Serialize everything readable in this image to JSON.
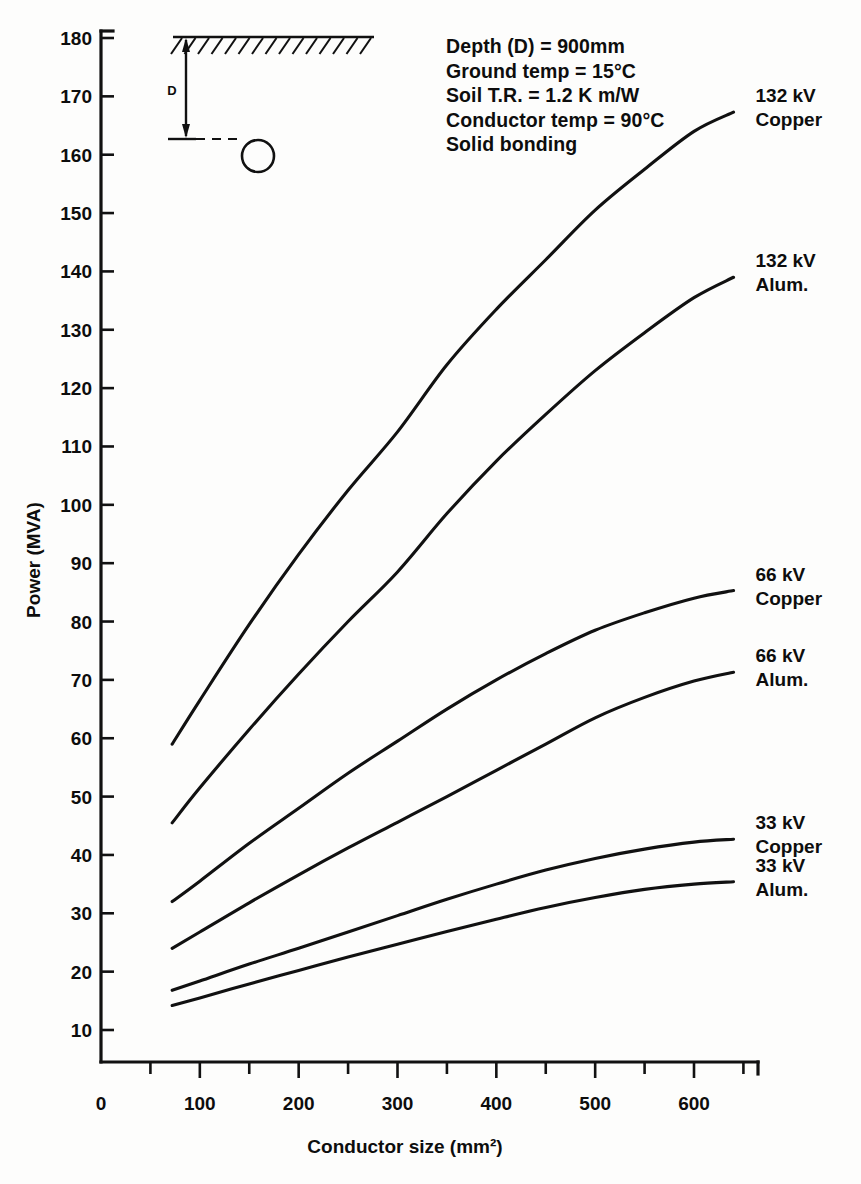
{
  "chart_data": {
    "type": "line",
    "title": "",
    "xlabel": "Conductor size (mm²)",
    "ylabel": "Power (MVA)",
    "xlim": [
      0,
      660
    ],
    "ylim": [
      0,
      180
    ],
    "xticks": [
      0,
      100,
      200,
      300,
      400,
      500,
      600
    ],
    "xticklabels": [
      "0",
      "100",
      "200",
      "300",
      "400",
      "500",
      "600"
    ],
    "xminorticks": [
      50,
      150,
      250,
      350,
      450,
      550,
      650
    ],
    "yticks": [
      10,
      20,
      30,
      40,
      50,
      60,
      70,
      80,
      90,
      100,
      110,
      120,
      130,
      140,
      150,
      160,
      170,
      180
    ],
    "yticklabels": [
      "10",
      "20",
      "30",
      "40",
      "50",
      "60",
      "70",
      "80",
      "90",
      "100",
      "110",
      "120",
      "130",
      "140",
      "150",
      "160",
      "170",
      "180"
    ],
    "grid": false,
    "legend_position": "right-inline",
    "series": [
      {
        "name": "132 kV Copper",
        "label_lines": [
          "132 kV",
          "Copper"
        ],
        "x": [
          72,
          100,
          150,
          200,
          250,
          300,
          350,
          400,
          450,
          500,
          550,
          600,
          640
        ],
        "y": [
          59.0,
          66.5,
          79.5,
          91.5,
          102.5,
          112.5,
          124.0,
          133.5,
          142.0,
          150.5,
          157.5,
          164.0,
          167.3
        ]
      },
      {
        "name": "132 kV Alum.",
        "label_lines": [
          "132 kV",
          "Alum."
        ],
        "x": [
          72,
          100,
          150,
          200,
          250,
          300,
          350,
          400,
          450,
          500,
          550,
          600,
          640
        ],
        "y": [
          45.5,
          51.5,
          61.5,
          71.0,
          80.0,
          88.5,
          98.5,
          107.5,
          115.5,
          123.0,
          129.5,
          135.5,
          139.0
        ]
      },
      {
        "name": "66 kV Copper",
        "label_lines": [
          "66 kV",
          "Copper"
        ],
        "x": [
          72,
          100,
          150,
          200,
          250,
          300,
          350,
          400,
          450,
          500,
          550,
          600,
          640
        ],
        "y": [
          32.0,
          35.5,
          42.0,
          48.0,
          54.0,
          59.5,
          65.0,
          70.0,
          74.5,
          78.5,
          81.5,
          84.0,
          85.3
        ]
      },
      {
        "name": "66 kV Alum.",
        "label_lines": [
          "66 kV",
          "Alum."
        ],
        "x": [
          72,
          100,
          150,
          200,
          250,
          300,
          350,
          400,
          450,
          500,
          550,
          600,
          640
        ],
        "y": [
          24.0,
          26.8,
          31.8,
          36.6,
          41.2,
          45.6,
          50.0,
          54.5,
          59.0,
          63.5,
          67.0,
          69.8,
          71.3
        ]
      },
      {
        "name": "33 kV Copper",
        "label_lines": [
          "33 kV",
          "Copper"
        ],
        "x": [
          72,
          100,
          150,
          200,
          250,
          300,
          350,
          400,
          450,
          500,
          550,
          600,
          640
        ],
        "y": [
          16.8,
          18.4,
          21.3,
          24.0,
          26.8,
          29.6,
          32.4,
          35.0,
          37.4,
          39.4,
          41.0,
          42.2,
          42.7
        ]
      },
      {
        "name": "33 kV Alum.",
        "label_lines": [
          "33 kV",
          "Alum."
        ],
        "x": [
          72,
          100,
          150,
          200,
          250,
          300,
          350,
          400,
          450,
          500,
          550,
          600,
          640
        ],
        "y": [
          14.2,
          15.5,
          17.9,
          20.2,
          22.5,
          24.7,
          26.9,
          29.0,
          31.0,
          32.7,
          34.1,
          35.0,
          35.4
        ]
      }
    ]
  },
  "annotations": {
    "lines": [
      "Depth (D)  =  900mm",
      "Ground temp  =  15°C",
      "Soil T.R.  =  1.2  K m/W",
      "Conductor temp  =  90°C",
      "Solid bonding"
    ]
  },
  "inset": {
    "dimension_label": "D",
    "elements": [
      "ground-surface-hatching",
      "depth-dimension-arrow",
      "dashed-level-line",
      "cable-circle"
    ]
  },
  "colors": {
    "ink": "#111111",
    "background": "#fdfdfc"
  }
}
